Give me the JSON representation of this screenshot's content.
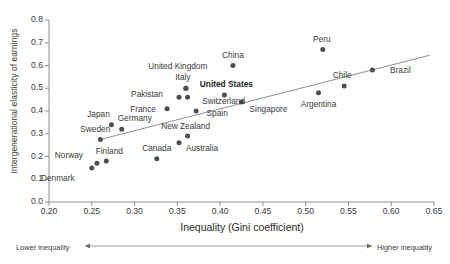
{
  "chart_data": {
    "type": "scatter",
    "title": "",
    "xlabel": "Inequality (Gini coefficient)",
    "ylabel": "Intergenerational elasticity of earnings",
    "xlim": [
      0.2,
      0.65
    ],
    "ylim": [
      0.0,
      0.8
    ],
    "xticks": [
      "0.20",
      "0.25",
      "0.30",
      "0.35",
      "0.40",
      "0.45",
      "0.50",
      "0.55",
      "0.60",
      "0.65"
    ],
    "yticks": [
      "0.0",
      "0.1",
      "0.2",
      "0.3",
      "0.4",
      "0.5",
      "0.6",
      "0.7",
      "0.8"
    ],
    "grid": false,
    "legend": null,
    "point_color": "#4d4d52",
    "trendline_color": "#8e8e93",
    "axis_color": "#8e8e93",
    "trendline": {
      "x0": 0.26,
      "y0": 0.275,
      "x1": 0.645,
      "y1": 0.645
    },
    "points": [
      {
        "label": "Denmark",
        "x": 0.25,
        "y": 0.15,
        "label_dx": -34,
        "label_dy": 10,
        "bold": false
      },
      {
        "label": "Norway",
        "x": 0.256,
        "y": 0.17,
        "label_dx": -28,
        "label_dy": -8,
        "bold": false
      },
      {
        "label": "Finland",
        "x": 0.267,
        "y": 0.18,
        "label_dx": 3,
        "label_dy": -10,
        "bold": false
      },
      {
        "label": "Sweden",
        "x": 0.26,
        "y": 0.275,
        "label_dx": -5,
        "label_dy": -10,
        "bold": false
      },
      {
        "label": "Japan",
        "x": 0.273,
        "y": 0.34,
        "label_dx": -13,
        "label_dy": -11,
        "bold": false
      },
      {
        "label": "Germany",
        "x": 0.285,
        "y": 0.32,
        "label_dx": 13,
        "label_dy": -11,
        "bold": false
      },
      {
        "label": "Canada",
        "x": 0.326,
        "y": 0.19,
        "label_dx": 0,
        "label_dy": -11,
        "bold": false
      },
      {
        "label": "France",
        "x": 0.338,
        "y": 0.41,
        "label_dx": -24,
        "label_dy": 0,
        "bold": false
      },
      {
        "label": "Australia",
        "x": 0.352,
        "y": 0.26,
        "label_dx": 23,
        "label_dy": 5,
        "bold": false
      },
      {
        "label": "New Zealand",
        "x": 0.362,
        "y": 0.29,
        "label_dx": -2,
        "label_dy": -10,
        "bold": false
      },
      {
        "label": "Pakistan",
        "x": 0.352,
        "y": 0.46,
        "label_dx": -32,
        "label_dy": -3,
        "bold": false
      },
      {
        "label": "Switzerland",
        "x": 0.362,
        "y": 0.46,
        "label_dx": 36,
        "label_dy": 4,
        "bold": false
      },
      {
        "label": "Spain",
        "x": 0.372,
        "y": 0.4,
        "label_dx": 21,
        "label_dy": 2,
        "bold": false
      },
      {
        "label": "Italy",
        "x": 0.36,
        "y": 0.5,
        "label_dx": -3,
        "label_dy": -11,
        "bold": false
      },
      {
        "label": "United Kingdom",
        "x": 0.36,
        "y": 0.5,
        "label_dx": -8,
        "label_dy": -22,
        "bold": false
      },
      {
        "label": "United States",
        "x": 0.405,
        "y": 0.47,
        "label_dx": 2,
        "label_dy": -11,
        "bold": true
      },
      {
        "label": "China",
        "x": 0.415,
        "y": 0.6,
        "label_dx": 0,
        "label_dy": -11,
        "bold": false
      },
      {
        "label": "Singapore",
        "x": 0.425,
        "y": 0.44,
        "label_dx": 27,
        "label_dy": 7,
        "bold": false
      },
      {
        "label": "Peru",
        "x": 0.52,
        "y": 0.67,
        "label_dx": -1,
        "label_dy": -11,
        "bold": false
      },
      {
        "label": "Argentina",
        "x": 0.515,
        "y": 0.48,
        "label_dx": 0,
        "label_dy": 11,
        "bold": false
      },
      {
        "label": "Chile",
        "x": 0.545,
        "y": 0.51,
        "label_dx": -2,
        "label_dy": -11,
        "bold": false
      },
      {
        "label": "Brazil",
        "x": 0.578,
        "y": 0.58,
        "label_dx": 28,
        "label_dy": 0,
        "bold": false
      }
    ],
    "annotations": {
      "left_arrow_label": "Lower inequality",
      "right_arrow_label": "Higher inequality"
    }
  }
}
